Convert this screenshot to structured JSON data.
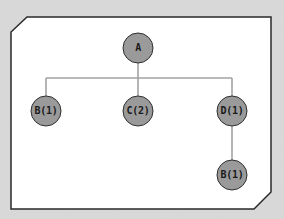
{
  "diagram": {
    "type": "tree",
    "colors": {
      "background": "#d9d9d9",
      "panel_fill": "#ffffff",
      "panel_border": "#2a2a2a",
      "node_fill": "#9a9a9a",
      "node_border": "#2e2e2e",
      "edge": "#a3a3a3",
      "label": "#1a1a1a"
    },
    "nodes": [
      {
        "id": "a",
        "label": "A",
        "x": 138,
        "y": 48
      },
      {
        "id": "b1",
        "label": "B(1)",
        "x": 46,
        "y": 111
      },
      {
        "id": "c2",
        "label": "C(2)",
        "x": 138,
        "y": 111
      },
      {
        "id": "d1",
        "label": "D(1)",
        "x": 232,
        "y": 111
      },
      {
        "id": "b1b",
        "label": "B(1)",
        "x": 232,
        "y": 175
      }
    ],
    "edges": [
      {
        "from": "a",
        "to": "b1"
      },
      {
        "from": "a",
        "to": "c2"
      },
      {
        "from": "a",
        "to": "d1"
      },
      {
        "from": "d1",
        "to": "b1b"
      }
    ]
  }
}
